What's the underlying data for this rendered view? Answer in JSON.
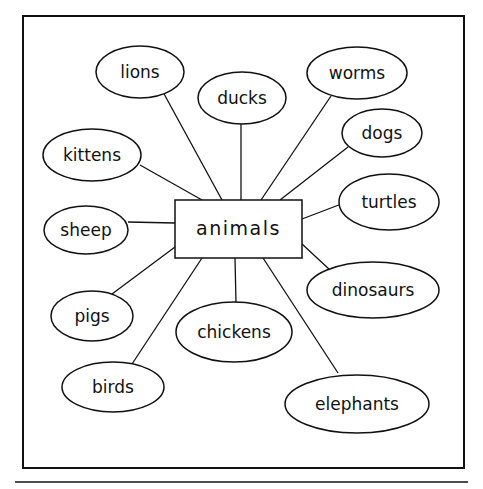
{
  "diagram": {
    "type": "concept-web",
    "center": {
      "label": "animals",
      "x": 175,
      "y": 200,
      "w": 127,
      "h": 58
    },
    "nodes": [
      {
        "id": "lions",
        "label": "lions",
        "cx": 140,
        "cy": 72,
        "rx": 44,
        "ry": 26,
        "edge": [
          [
            163,
            92
          ],
          [
            222,
            200
          ]
        ]
      },
      {
        "id": "ducks",
        "label": "ducks",
        "cx": 242,
        "cy": 98,
        "rx": 44,
        "ry": 26,
        "edge": [
          [
            241,
            123
          ],
          [
            241,
            200
          ]
        ]
      },
      {
        "id": "worms",
        "label": "worms",
        "cx": 357,
        "cy": 73,
        "rx": 50,
        "ry": 26,
        "edge": [
          [
            331,
            96
          ],
          [
            261,
            200
          ]
        ]
      },
      {
        "id": "dogs",
        "label": "dogs",
        "cx": 382,
        "cy": 133,
        "rx": 40,
        "ry": 24,
        "edge": [
          [
            348,
            147
          ],
          [
            280,
            200
          ]
        ]
      },
      {
        "id": "kittens",
        "label": "kittens",
        "cx": 92,
        "cy": 155,
        "rx": 49,
        "ry": 26,
        "edge": [
          [
            140,
            165
          ],
          [
            202,
            200
          ]
        ]
      },
      {
        "id": "turtles",
        "label": "turtles",
        "cx": 389,
        "cy": 202,
        "rx": 50,
        "ry": 28,
        "edge": [
          [
            344,
            203
          ],
          [
            302,
            219
          ]
        ]
      },
      {
        "id": "sheep",
        "label": "sheep",
        "cx": 86,
        "cy": 230,
        "rx": 42,
        "ry": 24,
        "edge": [
          [
            128,
            222
          ],
          [
            175,
            223
          ]
        ]
      },
      {
        "id": "dinosaurs",
        "label": "dinosaurs",
        "cx": 373,
        "cy": 290,
        "rx": 66,
        "ry": 28,
        "edge": [
          [
            330,
            270
          ],
          [
            302,
            244
          ]
        ]
      },
      {
        "id": "pigs",
        "label": "pigs",
        "cx": 92,
        "cy": 316,
        "rx": 41,
        "ry": 25,
        "edge": [
          [
            112,
            294
          ],
          [
            175,
            247
          ]
        ]
      },
      {
        "id": "chickens",
        "label": "chickens",
        "cx": 234,
        "cy": 332,
        "rx": 58,
        "ry": 30,
        "edge": [
          [
            236,
            303
          ],
          [
            235,
            258
          ]
        ]
      },
      {
        "id": "birds",
        "label": "birds",
        "cx": 113,
        "cy": 387,
        "rx": 51,
        "ry": 25,
        "edge": [
          [
            132,
            364
          ],
          [
            202,
            258
          ]
        ]
      },
      {
        "id": "elephants",
        "label": "elephants",
        "cx": 357,
        "cy": 404,
        "rx": 72,
        "ry": 29,
        "edge": [
          [
            338,
            373
          ],
          [
            263,
            258
          ]
        ]
      }
    ]
  },
  "colors": {
    "ink": "#111111",
    "paper": "#ffffff"
  }
}
